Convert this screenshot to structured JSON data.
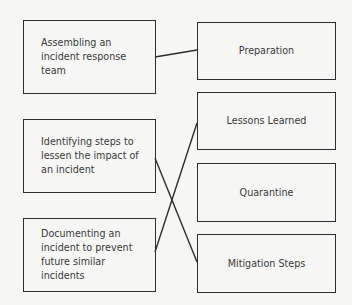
{
  "diagram": {
    "type": "matching",
    "left_items": [
      {
        "id": "L1",
        "label": "Assembling an incident response team"
      },
      {
        "id": "L2",
        "label": "Identifying steps to lessen the impact of an incident"
      },
      {
        "id": "L3",
        "label": "Documenting an incident to prevent future similar incidents"
      }
    ],
    "right_items": [
      {
        "id": "R1",
        "label": "Preparation"
      },
      {
        "id": "R2",
        "label": "Lessons Learned"
      },
      {
        "id": "R3",
        "label": "Quarantine"
      },
      {
        "id": "R4",
        "label": "Mitigation Steps"
      }
    ],
    "connections": [
      {
        "from": "L1",
        "to": "R1"
      },
      {
        "from": "L2",
        "to": "R4"
      },
      {
        "from": "L3",
        "to": "R2"
      }
    ],
    "colors": {
      "line": "#2e2e2e",
      "text": "#3a3a3a",
      "background": "#f6f6f4"
    }
  }
}
